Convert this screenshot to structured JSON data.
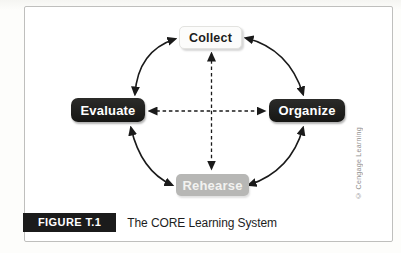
{
  "figure": {
    "label": "FIGURE T.1",
    "title": "The CORE Learning System"
  },
  "credit": "© Cengage Learning",
  "nodes": {
    "collect": {
      "label": "Collect",
      "position": "top",
      "bg": "#fcfcfb",
      "text_color": "#1c1c1c"
    },
    "organize": {
      "label": "Organize",
      "position": "right",
      "bg": "#1d1d1b",
      "text_color": "#ffffff"
    },
    "rehearse": {
      "label": "Rehearse",
      "position": "bottom",
      "bg": "#b7b7b5",
      "text_color": "#f2f2f0"
    },
    "evaluate": {
      "label": "Evaluate",
      "position": "left",
      "bg": "#1d1d1b",
      "text_color": "#ffffff"
    }
  },
  "diagram_data": {
    "type": "cycle-diagram",
    "outer_edges": [
      {
        "from": "Evaluate",
        "to": "Collect",
        "style": "solid-curved",
        "bidirectional": true
      },
      {
        "from": "Collect",
        "to": "Organize",
        "style": "solid-curved",
        "bidirectional": true
      },
      {
        "from": "Organize",
        "to": "Rehearse",
        "style": "solid-curved",
        "bidirectional": true
      },
      {
        "from": "Rehearse",
        "to": "Evaluate",
        "style": "solid-curved",
        "bidirectional": true
      }
    ],
    "inner_edges": [
      {
        "from": "Collect",
        "to": "Rehearse",
        "style": "dashed",
        "bidirectional": true
      },
      {
        "from": "Evaluate",
        "to": "Organize",
        "style": "dashed",
        "bidirectional": true
      }
    ]
  },
  "colors": {
    "arrow": "#1a1a1a",
    "panel_border": "#bfbfbd",
    "panel_bg": "#ffffff",
    "page_bg": "#fcfcfa",
    "caption_tag_bg": "#1b1b1b",
    "caption_tag_text": "#ffffff",
    "credit_text": "#8f8f8f"
  }
}
